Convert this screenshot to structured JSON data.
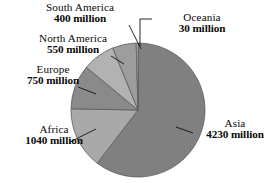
{
  "chart_data": {
    "type": "pie",
    "title": "",
    "subtitle": "",
    "unit": "million",
    "total": 7000,
    "start_angle_deg": 0,
    "direction": "clockwise",
    "legend": "none",
    "labels_position": "outside-with-leader-lines",
    "categories": [
      "Asia",
      "Africa",
      "Europe",
      "North America",
      "South America",
      "Oceania"
    ],
    "values": [
      4230,
      1040,
      750,
      550,
      400,
      30
    ],
    "slices": [
      {
        "name": "Asia",
        "value": 4230,
        "value_text": "4230 million",
        "color": "#808080",
        "start_deg": 0.0,
        "sweep_deg": 217.54
      },
      {
        "name": "Africa",
        "value": 1040,
        "value_text": "1040 million",
        "color": "#a9a9a9",
        "start_deg": 217.54,
        "sweep_deg": 53.49
      },
      {
        "name": "Europe",
        "value": 750,
        "value_text": "750 million",
        "color": "#8a8a8a",
        "start_deg": 271.03,
        "sweep_deg": 38.57
      },
      {
        "name": "North America",
        "value": 550,
        "value_text": "550 million",
        "color": "#b2b2b2",
        "start_deg": 309.6,
        "sweep_deg": 28.29
      },
      {
        "name": "South America",
        "value": 400,
        "value_text": "400 million",
        "color": "#9d9d9d",
        "start_deg": 337.89,
        "sweep_deg": 20.57
      },
      {
        "name": "Oceania",
        "value": 30,
        "value_text": "30 million",
        "color": "#c4c4c4",
        "start_deg": 358.46,
        "sweep_deg": 1.54
      }
    ],
    "geometry": {
      "cx": 138,
      "cy": 110,
      "r": 67,
      "stroke": "#5a5a5a",
      "stroke_width": 0.8
    }
  },
  "labels": {
    "south_america": {
      "name": "South America",
      "value_text": "400 million"
    },
    "north_america": {
      "name": "North America",
      "value_text": "550 million"
    },
    "europe": {
      "name": "Europe",
      "value_text": "750 million"
    },
    "africa": {
      "name": "Africa",
      "value_text": "1040 million"
    },
    "oceania": {
      "name": "Oceania",
      "value_text": "30 million"
    },
    "asia": {
      "name": "Asia",
      "value_text": "4230 million"
    }
  }
}
